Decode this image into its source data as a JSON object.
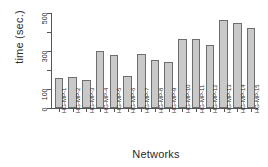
{
  "chart_data": {
    "type": "bar",
    "title": "",
    "xlabel": "Networks",
    "ylabel": "time (sec.)",
    "ylim": [
      0,
      500
    ],
    "grid": false,
    "legend": "none",
    "y_ticks": [
      0,
      100,
      200,
      300,
      400,
      500
    ],
    "y_tick_labels": [
      "0",
      "100",
      "",
      "300",
      "",
      "500"
    ],
    "categories": [
      "HG-MP-1",
      "HG-MP-2",
      "HG-MP-3",
      "HG-MP-4",
      "HG-MP-5",
      "HG-MP-6",
      "HG-MP-7",
      "HG-MP-8",
      "HG-MP-9",
      "HG-MP-10",
      "HG-MP-11",
      "HG-MP-12",
      "HG-MP-13",
      "HG-MP-14",
      "HG-MP-15"
    ],
    "values": [
      160,
      165,
      148,
      300,
      278,
      168,
      285,
      255,
      240,
      365,
      363,
      330,
      463,
      450,
      420
    ],
    "bar_color": "#c9c9c9",
    "bar_border_color": "#6e6e6e",
    "axis_color": "#555555"
  }
}
